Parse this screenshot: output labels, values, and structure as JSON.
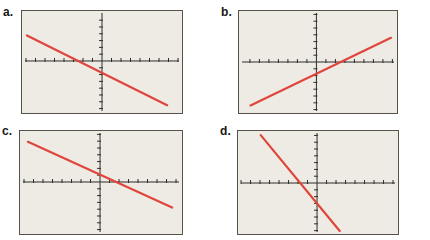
{
  "colors": {
    "screen_bg": "#edebe3",
    "box_border": "#56524a",
    "axis": "#2e2d2b",
    "line": "#e0453c",
    "label": "#181715"
  },
  "panels": [
    {
      "id": "a",
      "label": "a.",
      "axis": {
        "x_frac": 0.5,
        "y_frac": 0.49
      },
      "ticks": {
        "x_per_side": 8,
        "x_spacing": 9.5,
        "y_per_side": 7,
        "y_spacing": 6.8
      },
      "line_frac": {
        "x1": 0.031,
        "y1": 0.24,
        "x2": 0.907,
        "y2": 0.923
      }
    },
    {
      "id": "b",
      "label": "b.",
      "axis": {
        "x_frac": 0.49,
        "y_frac": 0.5
      },
      "ticks": {
        "x_per_side": 8,
        "x_spacing": 9.5,
        "y_per_side": 7,
        "y_spacing": 6.8
      },
      "line_frac": {
        "x1": 0.073,
        "y1": 0.926,
        "x2": 0.962,
        "y2": 0.263
      }
    },
    {
      "id": "c",
      "label": "c.",
      "axis": {
        "x_frac": 0.494,
        "y_frac": 0.495
      },
      "ticks": {
        "x_per_side": 8,
        "x_spacing": 9.5,
        "y_per_side": 7,
        "y_spacing": 6.8
      },
      "line_frac": {
        "x1": 0.049,
        "y1": 0.105,
        "x2": 0.939,
        "y2": 0.743
      }
    },
    {
      "id": "d",
      "label": "d.",
      "axis": {
        "x_frac": 0.494,
        "y_frac": 0.505
      },
      "ticks": {
        "x_per_side": 8,
        "x_spacing": 9.5,
        "y_per_side": 7,
        "y_spacing": 6.8
      },
      "line_frac": {
        "x1": 0.142,
        "y1": 0.04,
        "x2": 0.636,
        "y2": 0.971
      }
    }
  ],
  "chart_data": [
    {
      "type": "line",
      "panel": "a",
      "title": "",
      "xlabel": "",
      "ylabel": "",
      "window": {
        "xlim": [
          -8.5,
          8.5
        ],
        "ylim": [
          -7.5,
          7.5
        ],
        "xscl": 1,
        "yscl": 1
      },
      "grid": false,
      "legend": "none",
      "series": [
        {
          "name": "line-a",
          "endpoints": [
            [
              -8.0,
              3.9
            ],
            [
              6.9,
              -6.7
            ]
          ],
          "slope": -0.7,
          "y_intercept": -1.8,
          "x_intercept": -2.5
        }
      ]
    },
    {
      "type": "line",
      "panel": "b",
      "title": "",
      "xlabel": "",
      "ylabel": "",
      "window": {
        "xlim": [
          -8.5,
          8.5
        ],
        "ylim": [
          -7.5,
          7.5
        ],
        "xscl": 1,
        "yscl": 1
      },
      "grid": false,
      "legend": "none",
      "series": [
        {
          "name": "line-b",
          "endpoints": [
            [
              -7.1,
              -6.7
            ],
            [
              7.9,
              3.6
            ]
          ],
          "slope": 0.7,
          "y_intercept": -1.7,
          "x_intercept": 2.5
        }
      ]
    },
    {
      "type": "line",
      "panel": "c",
      "title": "",
      "xlabel": "",
      "ylabel": "",
      "window": {
        "xlim": [
          -8.5,
          8.5
        ],
        "ylim": [
          -7.5,
          7.5
        ],
        "xscl": 1,
        "yscl": 1
      },
      "grid": false,
      "legend": "none",
      "series": [
        {
          "name": "line-c",
          "endpoints": [
            [
              -7.6,
              6.0
            ],
            [
              7.6,
              -3.8
            ]
          ],
          "slope": -0.65,
          "y_intercept": 1.1,
          "x_intercept": 1.7
        }
      ]
    },
    {
      "type": "line",
      "panel": "d",
      "title": "",
      "xlabel": "",
      "ylabel": "",
      "window": {
        "xlim": [
          -8.5,
          8.5
        ],
        "ylim": [
          -7.5,
          7.5
        ],
        "xscl": 1,
        "yscl": 1
      },
      "grid": false,
      "legend": "none",
      "series": [
        {
          "name": "line-d",
          "endpoints": [
            [
              -6.0,
              6.9
            ],
            [
              2.4,
              -7.3
            ]
          ],
          "slope": -1.7,
          "y_intercept": -3.2,
          "x_intercept": -1.9
        }
      ]
    }
  ]
}
